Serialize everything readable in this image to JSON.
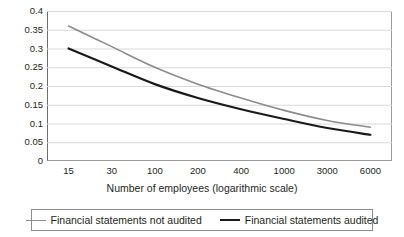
{
  "chart_data": {
    "type": "line",
    "title": "",
    "xlabel": "Number of employees (logarithmic scale)",
    "ylabel": "",
    "x_scale": "logarithmic",
    "categories": [
      "15",
      "30",
      "100",
      "200",
      "400",
      "1000",
      "3000",
      "6000"
    ],
    "x_tick_labels": [
      "15",
      "30",
      "100",
      "200",
      "400",
      "1000",
      "3000",
      "6000"
    ],
    "y_tick_labels": [
      "0",
      "0.05",
      "0.1",
      "0.15",
      "0.2",
      "0.25",
      "0.3",
      "0.35",
      "0.4"
    ],
    "y_tick_values": [
      0,
      0.05,
      0.1,
      0.15,
      0.2,
      0.25,
      0.3,
      0.35,
      0.4
    ],
    "ylim": [
      0,
      0.4
    ],
    "grid": "horizontal",
    "legend_position": "bottom",
    "series": [
      {
        "name": "Financial statements not audited",
        "color": "#8c8c8c",
        "values": [
          0.36,
          0.305,
          0.25,
          0.205,
          0.168,
          0.135,
          0.108,
          0.09
        ]
      },
      {
        "name": "Financial statements audited",
        "color": "#1a1a1a",
        "values": [
          0.3,
          0.252,
          0.205,
          0.168,
          0.138,
          0.112,
          0.088,
          0.07
        ]
      }
    ]
  },
  "legend": {
    "items": [
      {
        "label": "Financial statements not audited",
        "color": "#8c8c8c",
        "width": 1.6
      },
      {
        "label": "Financial statements audited",
        "color": "#1a1a1a",
        "width": 2.2
      }
    ]
  },
  "axes": {
    "x_title": "Number of employees (logarithmic scale)"
  },
  "colors": {
    "grid": "#d9d9d9",
    "frame": "#9a9a9a",
    "text": "#231f20",
    "background": "#ffffff"
  }
}
